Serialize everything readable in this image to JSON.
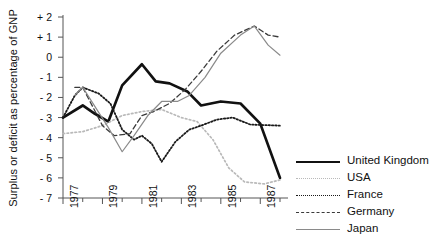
{
  "axes": {
    "ylabel": "Surplus or deficit as percentage of GNP",
    "yticks": [
      "+ 2",
      "+ 1",
      "0",
      "- 1",
      "- 2",
      "- 3",
      "- 4",
      "- 5",
      "- 6",
      "- 7"
    ],
    "ytick_values": [
      2,
      1,
      0,
      -1,
      -2,
      -3,
      -4,
      -5,
      -6,
      -7
    ],
    "xticks": [
      "1977",
      "1979",
      "1981",
      "1983",
      "1985",
      "1987"
    ],
    "xtick_values": [
      1977,
      1979,
      1981,
      1983,
      1985,
      1987
    ],
    "xlabel": ""
  },
  "legend": {
    "items": [
      {
        "label": "United Kingdom",
        "style": "solid-thick",
        "color": "#111111"
      },
      {
        "label": "USA",
        "style": "dotted-light",
        "color": "#b9b9b9"
      },
      {
        "label": "France",
        "style": "dotted-fine",
        "color": "#1a1a1a"
      },
      {
        "label": "Germany",
        "style": "dashed",
        "color": "#3a3a3a"
      },
      {
        "label": "Japan",
        "style": "solid-thin",
        "color": "#8a8a8a"
      }
    ]
  },
  "chart_data": {
    "type": "line",
    "title": "",
    "xlabel": "",
    "ylabel": "Surplus or deficit as percentage of GNP",
    "xlim": [
      1977,
      1988
    ],
    "ylim": [
      -7,
      2
    ],
    "grid": false,
    "legend_position": "right",
    "x": [
      1977,
      1978,
      1979,
      1980,
      1981,
      1982,
      1983,
      1984,
      1985,
      1986,
      1987,
      1988
    ],
    "series": [
      {
        "name": "United Kingdom",
        "style": "solid-thick",
        "color": "#111111",
        "values": [
          -3.0,
          -2.4,
          -2.8,
          -3.2,
          -1.4,
          -0.35,
          -1.2,
          -1.3,
          -1.7,
          -2.4,
          -2.2,
          -2.3,
          -3.3,
          -6.0
        ],
        "x": [
          1977,
          1978,
          1978.6,
          1979.3,
          1980,
          1981,
          1981.7,
          1982.4,
          1983.3,
          1984,
          1985,
          1986,
          1987,
          1988
        ]
      },
      {
        "name": "USA",
        "style": "dotted-light",
        "color": "#b9b9b9",
        "values": [
          -3.8,
          -3.7,
          -3.4,
          -2.9,
          -2.7,
          -2.6,
          -3.0,
          -3.2,
          -4.1,
          -5.5,
          -6.2,
          -6.3,
          -6.1
        ],
        "x": [
          1977,
          1978,
          1979,
          1980,
          1981,
          1982,
          1983,
          1983.8,
          1984.6,
          1985.4,
          1986.2,
          1987.2,
          1988
        ]
      },
      {
        "name": "France",
        "style": "dotted-fine",
        "color": "#1a1a1a",
        "values": [
          -3.0,
          -1.9,
          -1.5,
          -1.8,
          -2.3,
          -3.6,
          -4.1,
          -3.9,
          -4.3,
          -5.2,
          -4.2,
          -3.6,
          -3.4,
          -3.1,
          -3.0,
          -3.35,
          -3.4
        ],
        "x": [
          1977,
          1977.6,
          1978,
          1978.8,
          1979.4,
          1980,
          1980.6,
          1981,
          1981.5,
          1982,
          1982.7,
          1983.4,
          1984,
          1984.8,
          1985.6,
          1986.5,
          1988
        ]
      },
      {
        "name": "Germany",
        "style": "dashed",
        "color": "#3a3a3a",
        "values": [
          -1.5,
          -1.5,
          -3.4,
          -3.9,
          -3.8,
          -2.9,
          -2.7,
          -2.3,
          -1.6,
          -0.7,
          0.3,
          1.1,
          1.55,
          1.1,
          1.0
        ],
        "x": [
          1977.6,
          1978,
          1979,
          1979.6,
          1980.4,
          1981,
          1981.6,
          1982.4,
          1983.2,
          1984,
          1984.8,
          1985.7,
          1986.7,
          1987.4,
          1988
        ]
      },
      {
        "name": "Japan",
        "style": "solid-thin",
        "color": "#8a8a8a",
        "values": [
          -1.9,
          -1.5,
          -3.5,
          -4.7,
          -3.9,
          -2.9,
          -2.2,
          -2.2,
          -1.9,
          -1.0,
          0.2,
          1.1,
          1.55,
          0.6,
          0.1
        ],
        "x": [
          1977.6,
          1978,
          1979.3,
          1980,
          1980.6,
          1981.3,
          1982,
          1982.8,
          1983.4,
          1984.2,
          1985,
          1986,
          1986.7,
          1987.4,
          1988
        ]
      }
    ]
  }
}
